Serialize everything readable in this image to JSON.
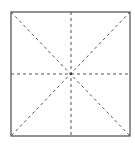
{
  "diagram": {
    "type": "square-with-guide-lines",
    "width": 135,
    "height": 147,
    "square": {
      "x1": 11,
      "y1": 12,
      "x2": 130,
      "y2": 136
    },
    "center": {
      "x": 71,
      "y": 74
    },
    "colors": {
      "border": "#4a4a4a",
      "dashed": "#555555",
      "background": "#ffffff"
    },
    "lines": [
      {
        "name": "vertical-center-line",
        "style": "dashed"
      },
      {
        "name": "horizontal-center-line",
        "style": "dashed"
      },
      {
        "name": "diagonal-tl-br",
        "style": "dashed"
      },
      {
        "name": "diagonal-tr-bl",
        "style": "dashed"
      }
    ]
  }
}
